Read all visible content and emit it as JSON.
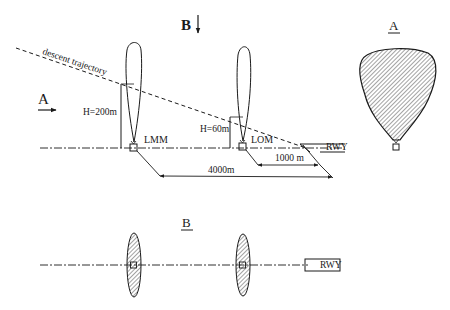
{
  "diagram": {
    "colors": {
      "ink": "#1a1a1a",
      "hatch": "#555555",
      "background": "#ffffff"
    },
    "side_view": {
      "view_marker_B": "B",
      "view_marker_A": "A",
      "trajectory_label": "descent trajectory",
      "lmm": {
        "label": "LMM",
        "height_label": "H=200m"
      },
      "lom": {
        "label": "LOM",
        "height_label": "H=60m"
      },
      "runway_label": "RWY",
      "distance_1000": "1000 m",
      "distance_4000": "4000m"
    },
    "view_A": {
      "title": "A"
    },
    "view_B": {
      "title": "B",
      "runway_label": "RWY"
    }
  }
}
